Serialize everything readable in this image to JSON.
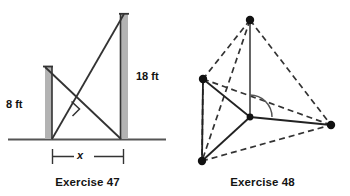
{
  "figure": {
    "panels": [
      {
        "id": "exercise-47",
        "caption": "Exercise 47",
        "type": "two-poles-crossed-wires-diagram",
        "labels": {
          "left_pole_height": "8 ft",
          "right_pole_height": "18 ft",
          "ground_distance": "x"
        },
        "colors": {
          "pole_fill": "#b3b3b3",
          "pole_edge": "#333333",
          "line": "#333333",
          "ground": "#555555",
          "text": "#111111"
        },
        "geometry": {
          "ground_y": 139,
          "left_pole": {
            "x": 45,
            "top_y": 66,
            "bottom_y": 139,
            "width": 7
          },
          "right_pole": {
            "x": 120,
            "top_y": 13,
            "bottom_y": 139,
            "width": 8
          },
          "wire_a": {
            "x1": 45,
            "y1": 66,
            "x2": 128,
            "y2": 139
          },
          "wire_b": {
            "x1": 52,
            "y1": 139,
            "x2": 124,
            "y2": 13
          },
          "right_angle_marker": {
            "x": 68,
            "y": 104,
            "size": 9
          },
          "dimension_line": {
            "x1": 52,
            "x2": 124,
            "y": 156
          }
        }
      },
      {
        "id": "exercise-48",
        "caption": "Exercise 48",
        "type": "tetrahedron-with-altitude-diagram",
        "colors": {
          "solid_line": "#333333",
          "dashed_line": "#333333",
          "vertex_dot": "#111111",
          "angle_arc": "#555555"
        },
        "geometry": {
          "vertices": {
            "apex": {
              "x": 250,
              "y": 20
            },
            "left": {
              "x": 203,
              "y": 79
            },
            "bottom_left": {
              "x": 202,
              "y": 161
            },
            "right": {
              "x": 331,
              "y": 125
            },
            "center": {
              "x": 250,
              "y": 117
            }
          },
          "solid_edges": [
            [
              "apex",
              "center"
            ],
            [
              "left",
              "center"
            ],
            [
              "bottom_left",
              "center"
            ],
            [
              "right",
              "center"
            ],
            [
              "left",
              "bottom_left"
            ]
          ],
          "dashed_edges": [
            [
              "apex",
              "left"
            ],
            [
              "apex",
              "bottom_left"
            ],
            [
              "apex",
              "right"
            ],
            [
              "left",
              "right"
            ],
            [
              "bottom_left",
              "right"
            ]
          ],
          "right_angle_arc": {
            "cx": 250,
            "cy": 117,
            "r": 22
          }
        }
      }
    ]
  }
}
